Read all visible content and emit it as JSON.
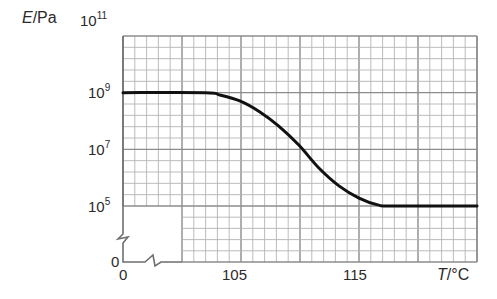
{
  "chart_data": {
    "type": "line",
    "title": "",
    "xlabel": "T/°C",
    "ylabel": "E/Pa",
    "x_label_var": "T",
    "x_label_unit": "/°C",
    "y_label_var": "E",
    "y_label_unit": "/Pa",
    "yscale": "log",
    "xlim": [
      95,
      125
    ],
    "ylim_exponents": [
      5,
      11
    ],
    "x_axis_break": true,
    "y_axis_break": true,
    "x_ticks": [
      {
        "value": 0,
        "label": "0"
      },
      {
        "value": 105,
        "label": "105"
      },
      {
        "value": 115,
        "label": "115"
      }
    ],
    "y_ticks": [
      {
        "exponent": 11,
        "base": "10",
        "sup": "11"
      },
      {
        "exponent": 9,
        "base": "10",
        "sup": "9"
      },
      {
        "exponent": 7,
        "base": "10",
        "sup": "7"
      },
      {
        "exponent": 5,
        "base": "10",
        "sup": "5"
      },
      {
        "exponent": null,
        "base": "0",
        "sup": ""
      }
    ],
    "grid": true,
    "series": [
      {
        "name": "E vs T",
        "color": "#111111",
        "x": [
          95,
          102,
          103.2,
          104.9,
          106.6,
          108.2,
          109.9,
          111.6,
          113.3,
          115.0,
          116.6,
          117.9,
          125
        ],
        "log10_y": [
          9.0,
          9.0,
          8.92,
          8.71,
          8.32,
          7.82,
          7.15,
          6.34,
          5.71,
          5.28,
          5.04,
          5.0,
          5.0
        ]
      }
    ]
  },
  "labels": {
    "y_axis": {
      "var": "E",
      "unit": "/Pa"
    },
    "x_axis": {
      "var": "T",
      "unit": "/°C"
    },
    "y_tick_11": {
      "base": "10",
      "sup": "11"
    },
    "y_tick_9": {
      "base": "10",
      "sup": "9"
    },
    "y_tick_7": {
      "base": "10",
      "sup": "7"
    },
    "y_tick_5": {
      "base": "10",
      "sup": "5"
    },
    "y_tick_0": "0",
    "x_tick_0": "0",
    "x_tick_105": "105",
    "x_tick_115": "115"
  },
  "colors": {
    "grid_minor": "#b4b4b4",
    "grid_major": "#8c8c8c",
    "axis": "#6e6e6e",
    "curve": "#111111",
    "text": "#2a2a2a"
  }
}
